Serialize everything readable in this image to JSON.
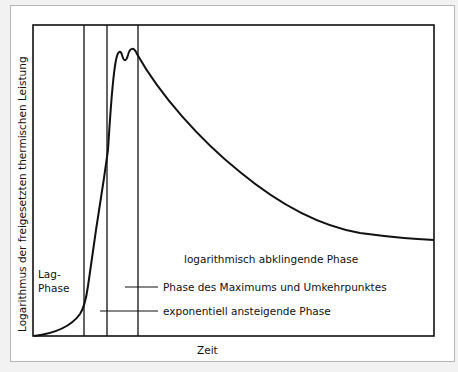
{
  "diagram": {
    "y_axis_label": "Logarithmus der freigesetzten thermischen Leistung",
    "x_axis_label": "Zeit",
    "phases": {
      "lag": [
        "Lag-",
        "Phase"
      ],
      "exponential": "exponentiell ansteigende Phase",
      "maximum": "Phase des Maximums und Umkehrpunktes",
      "decay": "logarithmisch abklingende Phase"
    },
    "colors": {
      "line": "#111111",
      "background": "#ffffff",
      "border": "#b5b5b5"
    }
  }
}
